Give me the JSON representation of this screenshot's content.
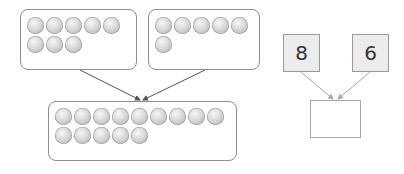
{
  "diagram": {
    "type": "addition-number-bond",
    "left_group": {
      "count": 8,
      "rows": [
        5,
        3
      ]
    },
    "right_group": {
      "count": 6,
      "rows": [
        5,
        1
      ]
    },
    "combined_group": {
      "count": 14,
      "rows": [
        8,
        6
      ]
    },
    "addends": [
      {
        "label": "8"
      },
      {
        "label": "6"
      }
    ],
    "answer": {
      "label": ""
    },
    "colors": {
      "ball": "#c8c8c8",
      "border": "#8e8e8e",
      "number_box_fill": "#ececec",
      "arrow": "#555555"
    }
  }
}
